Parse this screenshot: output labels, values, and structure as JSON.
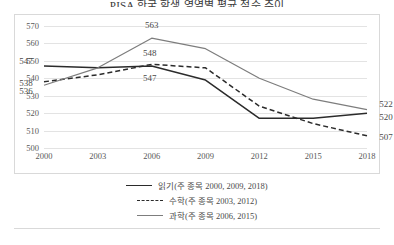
{
  "chart": {
    "title": "PISA 한국 학생 영역별 평균 점수 추이",
    "legend": [
      {
        "label": "읽기(주 종목 2000, 2009, 2018)",
        "style": "solid-dark"
      },
      {
        "label": "수학(주 종목 2003, 2012)",
        "style": "dashed-dark"
      },
      {
        "label": "과학(주 종목 2006, 2015)",
        "style": "solid-gray"
      }
    ]
  },
  "chart_data": {
    "type": "line",
    "title": "PISA 한국 학생 영역별 평균 점수 추이",
    "xlabel": "",
    "ylabel": "",
    "x": [
      "2000",
      "2003",
      "2006",
      "2009",
      "2012",
      "2015",
      "2018"
    ],
    "ylim": [
      500,
      570
    ],
    "yticks": [
      500,
      510,
      520,
      530,
      540,
      550,
      560,
      570
    ],
    "grid": true,
    "legend_position": "bottom",
    "series": [
      {
        "name": "읽기(주 종목 2000, 2009, 2018)",
        "color": "#2b2b2b",
        "dash": "solid",
        "values": [
          547,
          546,
          547,
          539,
          517,
          517,
          520
        ],
        "point_labels": [
          {
            "x": "2000",
            "value": 547,
            "text": "547"
          },
          {
            "x": "2006",
            "value": 547,
            "text": "547"
          },
          {
            "x": "2018",
            "value": 520,
            "text": "520"
          }
        ]
      },
      {
        "name": "수학(주 종목 2003, 2012)",
        "color": "#2b2b2b",
        "dash": "dashed",
        "values": [
          538,
          542,
          548,
          546,
          524,
          514,
          507
        ],
        "point_labels": [
          {
            "x": "2000",
            "value": 538,
            "text": "538"
          },
          {
            "x": "2006",
            "value": 548,
            "text": "548"
          },
          {
            "x": "2018",
            "value": 507,
            "text": "507"
          }
        ]
      },
      {
        "name": "과학(주 종목 2006, 2015)",
        "color": "#7d7d7d",
        "dash": "solid",
        "values": [
          536,
          546,
          563,
          557,
          540,
          528,
          522
        ],
        "point_labels": [
          {
            "x": "2000",
            "value": 536,
            "text": "536"
          },
          {
            "x": "2006",
            "value": 563,
            "text": "563"
          },
          {
            "x": "2018",
            "value": 522,
            "text": "522"
          }
        ]
      }
    ]
  }
}
